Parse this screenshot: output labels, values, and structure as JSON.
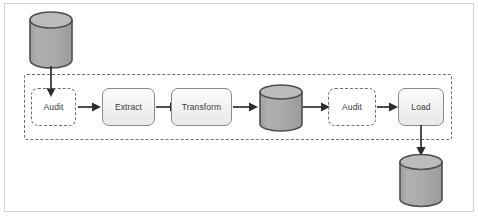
{
  "diagram": {
    "colors": {
      "frame_border": "#d2d2d2",
      "dashed_border": "#6f6f6f",
      "node_border": "#8a8a8a",
      "node_fill": "#f1f1f1",
      "cylinder_fill": "#a8a8a8",
      "cylinder_top": "#b4b4b4",
      "cylinder_stroke": "#555555",
      "arrow": "#2e2e2e",
      "text": "#3a3a3a",
      "background": "#ffffff"
    },
    "cylinders": [
      {
        "id": "source-database",
        "label": ""
      },
      {
        "id": "staging-database",
        "label": ""
      },
      {
        "id": "target-database",
        "label": ""
      }
    ],
    "nodes": [
      {
        "id": "audit-1",
        "label": "Audit",
        "style": "dashed"
      },
      {
        "id": "extract",
        "label": "Extract",
        "style": "solid"
      },
      {
        "id": "transform",
        "label": "Transform",
        "style": "solid"
      },
      {
        "id": "audit-2",
        "label": "Audit",
        "style": "dashed"
      },
      {
        "id": "load",
        "label": "Load",
        "style": "solid"
      }
    ],
    "arrows": [
      {
        "id": "source-to-audit-1",
        "direction": "down"
      },
      {
        "id": "audit-1-to-extract",
        "direction": "right"
      },
      {
        "id": "extract-to-transform",
        "direction": "right"
      },
      {
        "id": "transform-to-staging",
        "direction": "right"
      },
      {
        "id": "staging-to-audit-2",
        "direction": "right"
      },
      {
        "id": "audit-2-to-load",
        "direction": "right"
      },
      {
        "id": "load-to-target",
        "direction": "down"
      }
    ]
  }
}
